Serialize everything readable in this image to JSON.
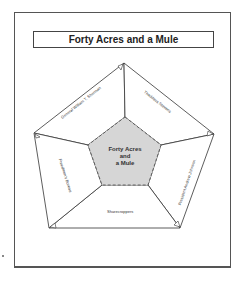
{
  "title": "Forty Acres and a Mule",
  "center": {
    "line1": "Forty Acres",
    "line2": "and",
    "line3": "a Mule"
  },
  "segments": [
    {
      "label": "General William T. Sherman",
      "position": "upper-left"
    },
    {
      "label": "Thaddeus Stevens",
      "position": "upper-right"
    },
    {
      "label": "President Andrew Johnson",
      "position": "lower-right"
    },
    {
      "label": "Sharecroppers",
      "position": "bottom"
    },
    {
      "label": "Freedmen's Bureau",
      "position": "lower-left"
    }
  ],
  "colors": {
    "center_fill": "#d6d6d6",
    "lines": "#333333",
    "frame": "#555555"
  }
}
